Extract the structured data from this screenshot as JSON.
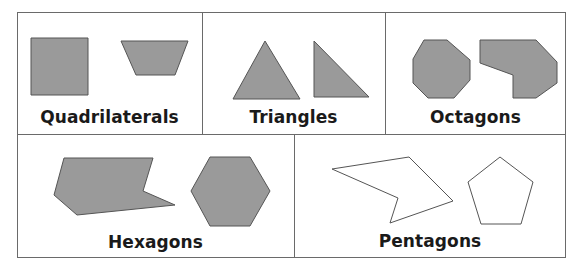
{
  "diagram": {
    "colors": {
      "filled_shape": "#9a9a9a",
      "outline": "#555555",
      "empty_shape": "#ffffff",
      "border": "#6a6a6a",
      "label_text": "#1a1a1a"
    },
    "cells": [
      {
        "label": "Quadrilaterals",
        "shapes": [
          "square",
          "trapezoid"
        ],
        "filled": true
      },
      {
        "label": "Triangles",
        "shapes": [
          "acute-triangle",
          "right-triangle"
        ],
        "filled": true
      },
      {
        "label": "Octagons",
        "shapes": [
          "regular-octagon",
          "irregular-octagon"
        ],
        "filled": true
      },
      {
        "label": "Hexagons",
        "shapes": [
          "concave-hexagon",
          "regular-hexagon"
        ],
        "filled": true
      },
      {
        "label": "Pentagons",
        "shapes": [
          "concave-pentagon",
          "regular-pentagon"
        ],
        "filled": false
      }
    ]
  }
}
